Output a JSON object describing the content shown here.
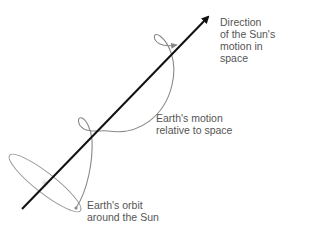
{
  "diagram": {
    "title": "Earth's motion relative to space",
    "colors": {
      "axis_arrow": "#111111",
      "curve": "#888888",
      "text": "#555555",
      "sun_glow": "#d8d8d8"
    },
    "labels": {
      "sun_direction": "Direction\nof the Sun's\nmotion in\nspace",
      "earth_motion": "Earth's motion\nrelative to space",
      "earth_orbit": "Earth's orbit\naround the Sun"
    }
  }
}
